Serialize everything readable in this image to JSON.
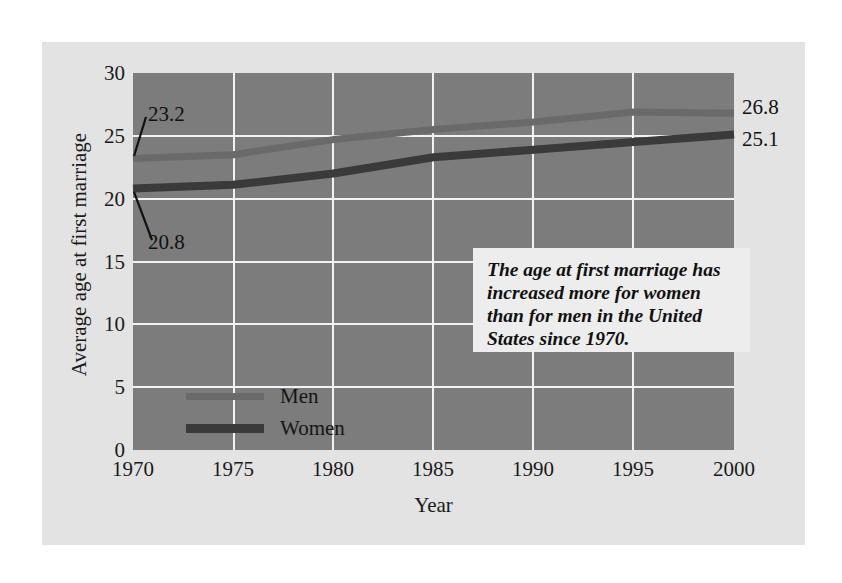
{
  "chart_data": {
    "type": "line",
    "title": "",
    "xlabel": "Year",
    "ylabel": "Average age at first marriage",
    "xlim": [
      1970,
      2000
    ],
    "ylim": [
      0,
      30
    ],
    "grid": true,
    "legend_position": "inside-lower-left",
    "x_ticks": [
      "1970",
      "1975",
      "1980",
      "1985",
      "1990",
      "1995",
      "2000"
    ],
    "y_ticks": [
      "0",
      "5",
      "10",
      "15",
      "20",
      "25",
      "30"
    ],
    "x": [
      1970,
      1975,
      1980,
      1985,
      1990,
      1995,
      2000
    ],
    "series": [
      {
        "name": "Men",
        "color": "#6a6a6a",
        "values": [
          23.2,
          23.5,
          24.7,
          25.5,
          26.1,
          26.9,
          26.8
        ]
      },
      {
        "name": "Women",
        "color": "#3a3a3a",
        "values": [
          20.8,
          21.1,
          22.0,
          23.3,
          23.9,
          24.5,
          25.1
        ]
      }
    ],
    "point_labels": [
      {
        "name": "men-1970",
        "text": "23.2",
        "series": "Men",
        "x": 1970,
        "y": 23.2
      },
      {
        "name": "women-1970",
        "text": "20.8",
        "series": "Women",
        "x": 1970,
        "y": 20.8
      },
      {
        "name": "men-2000",
        "text": "26.8",
        "series": "Men",
        "x": 2000,
        "y": 26.8
      },
      {
        "name": "women-2000",
        "text": "25.1",
        "series": "Women",
        "x": 2000,
        "y": 25.1
      }
    ],
    "annotations": [
      {
        "name": "summary-callout",
        "text": "The age at first marriage has increased more for women than for men in the United States since 1970."
      }
    ]
  },
  "axes": {
    "x_title": "Year",
    "y_title": "Average age at first marriage",
    "x_tick_labels": [
      "1970",
      "1975",
      "1980",
      "1985",
      "1990",
      "1995",
      "2000"
    ],
    "y_tick_labels": [
      "30",
      "25",
      "20",
      "15",
      "10",
      "5",
      "0"
    ]
  },
  "legend": {
    "items": [
      {
        "label": "Men",
        "color": "#6a6a6a"
      },
      {
        "label": "Women",
        "color": "#3a3a3a"
      }
    ]
  },
  "labels": {
    "start_men": "23.2",
    "start_women": "20.8",
    "end_men": "26.8",
    "end_women": "25.1"
  },
  "annotation": {
    "text": "The age at first marriage has increased more for women than for men in the United States since 1970."
  },
  "colors": {
    "plot_background": "#7c7c7c",
    "card_background": "#e3e3e3",
    "gridline": "#f2f2f2",
    "men_line": "#6a6a6a",
    "women_line": "#3a3a3a",
    "annotation_background": "#ededed",
    "text": "#111111"
  }
}
